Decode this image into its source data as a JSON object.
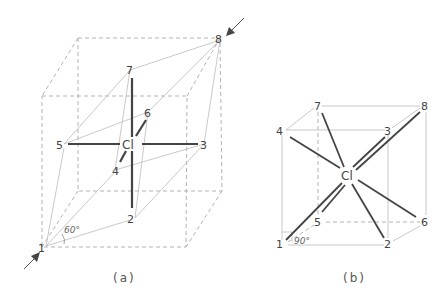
{
  "figure": {
    "panel_a": {
      "caption": "(a)",
      "central_atom": "Cl",
      "angle_label": "60°",
      "vertex_labels": {
        "v1": "1",
        "v2": "2",
        "v3": "3",
        "v4": "4",
        "v5": "5",
        "v6": "6",
        "v7": "7",
        "v8": "8"
      },
      "arrows": [
        "arrow-into-vertex-8",
        "arrow-into-vertex-1"
      ]
    },
    "panel_b": {
      "caption": "(b)",
      "central_atom": "Cl",
      "angle_label": "90°",
      "vertex_labels": {
        "v1": "1",
        "v2": "2",
        "v3": "3",
        "v4": "4",
        "v5": "5",
        "v6": "6",
        "v7": "7",
        "v8": "8"
      }
    },
    "colors": {
      "bond": "#444444",
      "dashed_edge": "#aaaaaa",
      "label": "#444444"
    }
  }
}
